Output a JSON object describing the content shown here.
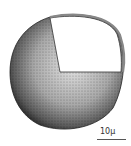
{
  "figure": {
    "scale_bar": {
      "label": "10µ"
    },
    "colors": {
      "stipple_dark": "#1a1a1a",
      "stipple_light": "#bdbdbd",
      "background": "#ffffff"
    }
  }
}
